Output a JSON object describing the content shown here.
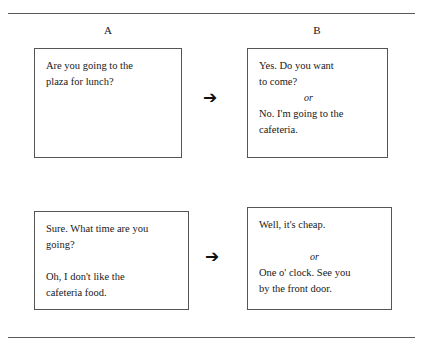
{
  "figure": {
    "columns": [
      {
        "id": "a",
        "label": "A"
      },
      {
        "id": "b",
        "label": "B"
      }
    ],
    "arrow_glyph": "➔",
    "rows": [
      {
        "left": {
          "lines": [
            "Are you going to the",
            "plaza for lunch?"
          ]
        },
        "arrow": "➔",
        "right": {
          "lines_before": [
            "Yes. Do you want",
            "to come?"
          ],
          "separator": "or",
          "lines_after": [
            "No. I'm going to the",
            "cafeteria."
          ]
        }
      },
      {
        "left": {
          "lines_before": [
            "Sure. What time are you",
            "going?"
          ],
          "lines_after": [
            "Oh, I don't like the",
            "cafeteria food."
          ]
        },
        "arrow": "➔",
        "right": {
          "lines_before": [
            "Well, it's cheap."
          ],
          "separator": "or",
          "lines_after": [
            "One o' clock. See you",
            "by the front door."
          ]
        }
      }
    ]
  }
}
